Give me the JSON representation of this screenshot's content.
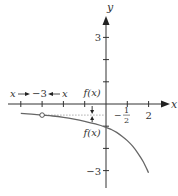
{
  "chart_data": {
    "type": "line",
    "title": "",
    "xlabel": "x",
    "ylabel": "y",
    "xlim": [
      -4.3,
      2.8
    ],
    "ylim": [
      -3.8,
      3.9
    ],
    "x_ticks": [
      -4,
      -3,
      -2,
      -1,
      1,
      2
    ],
    "y_ticks": [
      3,
      2,
      1,
      -1,
      -2,
      -3
    ],
    "x_tick_labels": [
      {
        "value": 2,
        "text": "2"
      }
    ],
    "y_tick_labels": [
      {
        "value": 3,
        "text": "3"
      },
      {
        "value": -3,
        "text": "−3"
      }
    ],
    "asymptote": {
      "y": -0.5,
      "label": "−½",
      "style": "dotted",
      "from_x": -3,
      "to_x": 0
    },
    "hole": {
      "x": -3,
      "y": -0.5
    },
    "series": [
      {
        "name": "f(x)",
        "points": [
          [
            -4,
            -0.42
          ],
          [
            -3.5,
            -0.46
          ],
          [
            -3,
            -0.5
          ],
          [
            -2.5,
            -0.54
          ],
          [
            -2,
            -0.6
          ],
          [
            -1.5,
            -0.68
          ],
          [
            -1,
            -0.78
          ],
          [
            -0.5,
            -0.9
          ],
          [
            0,
            -1.05
          ],
          [
            0.25,
            -1.15
          ],
          [
            0.5,
            -1.28
          ],
          [
            0.75,
            -1.45
          ],
          [
            1,
            -1.65
          ],
          [
            1.25,
            -1.9
          ],
          [
            1.5,
            -2.22
          ],
          [
            1.75,
            -2.6
          ],
          [
            2,
            -3.1
          ]
        ],
        "color": "#666666"
      }
    ],
    "annotations": [
      {
        "text": "x → −3 ← x",
        "near": "x-axis left, above"
      },
      {
        "text": "f(x)",
        "near": "above axis at x≈-0.7"
      },
      {
        "text": "f(x)",
        "near": "below curve at x≈-0.7"
      }
    ],
    "approach_labels": {
      "left_x": "x",
      "target": "−3",
      "right_x": "x"
    },
    "fx_label": "f(x)",
    "grid": false,
    "legend": "none"
  }
}
